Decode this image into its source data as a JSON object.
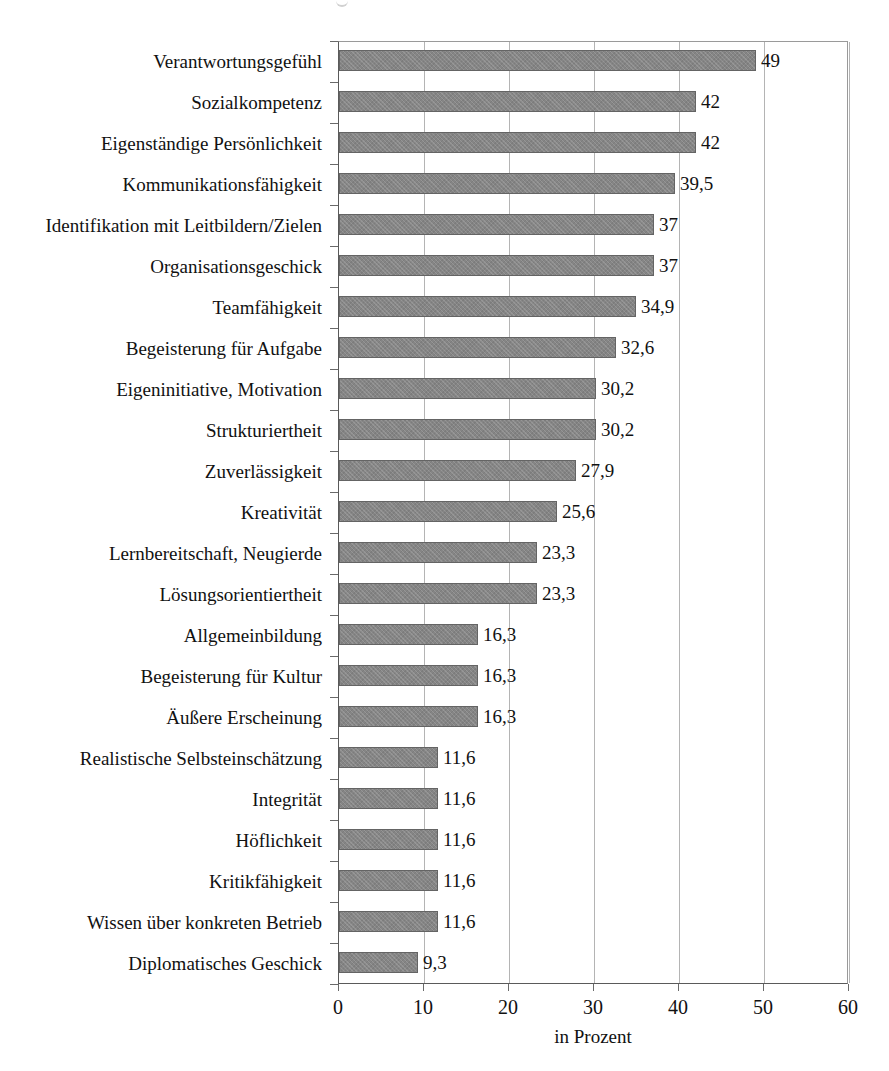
{
  "chart_data": {
    "type": "bar",
    "orientation": "horizontal",
    "title": "",
    "xlabel": "in Prozent",
    "ylabel": "",
    "xlim": [
      0,
      60
    ],
    "xticks": [
      0,
      10,
      20,
      30,
      40,
      50,
      60
    ],
    "xtick_labels": [
      "0",
      "10",
      "20",
      "30",
      "40",
      "50",
      "60"
    ],
    "grid": "vertical",
    "legend": "none",
    "bar_color": "#858585",
    "bar_edge_color": "#646464",
    "gridline_color": "#b4b4b4",
    "axis_color": "#5a5a5a",
    "decimal_separator": ",",
    "categories": [
      "Verantwortungsgefühl",
      "Sozialkompetenz",
      "Eigenständige Persönlichkeit",
      "Kommunikationsfähigkeit",
      "Identifikation mit Leitbildern/Zielen",
      "Organisationsgeschick",
      "Teamfähigkeit",
      "Begeisterung für Aufgabe",
      "Eigeninitiative, Motivation",
      "Strukturiertheit",
      "Zuverlässigkeit",
      "Kreativität",
      "Lernbereitschaft, Neugierde",
      "Lösungsorientiertheit",
      "Allgemeinbildung",
      "Begeisterung für Kultur",
      "Äußere Erscheinung",
      "Realistische Selbsteinschätzung",
      "Integrität",
      "Höflichkeit",
      "Kritikfähigkeit",
      "Wissen über konkreten Betrieb",
      "Diplomatisches Geschick"
    ],
    "values": [
      49,
      42,
      42,
      39.5,
      37,
      37,
      34.9,
      32.6,
      30.2,
      30.2,
      27.9,
      25.6,
      23.3,
      23.3,
      16.3,
      16.3,
      16.3,
      11.6,
      11.6,
      11.6,
      11.6,
      11.6,
      9.3
    ],
    "value_labels": [
      "49",
      "42",
      "42",
      "39,5",
      "37",
      "37",
      "34,9",
      "32,6",
      "30,2",
      "30,2",
      "27,9",
      "25,6",
      "23,3",
      "23,3",
      "16,3",
      "16,3",
      "16,3",
      "11,6",
      "11,6",
      "11,6",
      "11,6",
      "11,6",
      "9,3"
    ]
  }
}
